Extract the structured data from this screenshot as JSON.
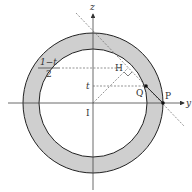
{
  "diagram": {
    "axes": {
      "horizontal": "y",
      "vertical": "z"
    },
    "points": {
      "center": "I",
      "P": "P",
      "Q": "Q",
      "H": "H"
    },
    "tick_labels": {
      "upper_num": "1−t",
      "upper_den": "2",
      "lower": "t"
    },
    "colors": {
      "ring_fill": "#cfcfcf",
      "stroke": "#222222",
      "dashed": "#666666"
    }
  }
}
